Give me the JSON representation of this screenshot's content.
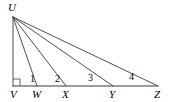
{
  "figure": {
    "type": "geometry-diagram",
    "background_color": "#ffffff",
    "line_color": "#3b3b3b",
    "canvas": {
      "width": 172,
      "height": 102
    },
    "apex": {
      "name": "U",
      "label": "U",
      "x": 13,
      "y": 17,
      "label_x": 8,
      "label_y": 11
    },
    "baseline": {
      "y": 86,
      "x_start": 13,
      "x_end": 158
    },
    "points": [
      {
        "name": "V",
        "label": "V",
        "x": 13,
        "y": 86,
        "label_x": 10,
        "label_y": 98
      },
      {
        "name": "W",
        "label": "W",
        "x": 37,
        "y": 86,
        "label_x": 32,
        "label_y": 98
      },
      {
        "name": "X",
        "label": "X",
        "x": 66,
        "y": 86,
        "label_x": 62,
        "label_y": 98
      },
      {
        "name": "Y",
        "label": "Y",
        "x": 113,
        "y": 86,
        "label_x": 109,
        "label_y": 98
      },
      {
        "name": "Z",
        "label": "Z",
        "x": 158,
        "y": 86,
        "label_x": 154,
        "label_y": 98
      }
    ],
    "rays": [
      {
        "name": "UV",
        "from": "U",
        "to": "V",
        "x1": 13,
        "y1": 17,
        "x2": 13,
        "y2": 86
      },
      {
        "name": "UW",
        "from": "U",
        "to": "W",
        "x1": 13,
        "y1": 17,
        "x2": 37,
        "y2": 86
      },
      {
        "name": "UX",
        "from": "U",
        "to": "X",
        "x1": 13,
        "y1": 17,
        "x2": 66,
        "y2": 86
      },
      {
        "name": "UY",
        "from": "U",
        "to": "Y",
        "x1": 13,
        "y1": 17,
        "x2": 113,
        "y2": 86
      },
      {
        "name": "UZ",
        "from": "U",
        "to": "Z",
        "x1": 13,
        "y1": 17,
        "x2": 158,
        "y2": 86
      }
    ],
    "angle_labels": [
      {
        "name": "angle-1",
        "label": "1",
        "x": 30,
        "y": 82,
        "between": "UV and UW"
      },
      {
        "name": "angle-2",
        "label": "2",
        "x": 55,
        "y": 82,
        "between": "UW and UX"
      },
      {
        "name": "angle-3",
        "label": "3",
        "x": 88,
        "y": 81,
        "between": "UX and UY"
      },
      {
        "name": "angle-4",
        "label": "4",
        "x": 129,
        "y": 80,
        "between": "UY and UZ"
      }
    ],
    "right_angle_marker": {
      "name": "right-angle-at-V",
      "at_vertex": "V",
      "x": 13,
      "y": 86,
      "size": 7
    }
  }
}
